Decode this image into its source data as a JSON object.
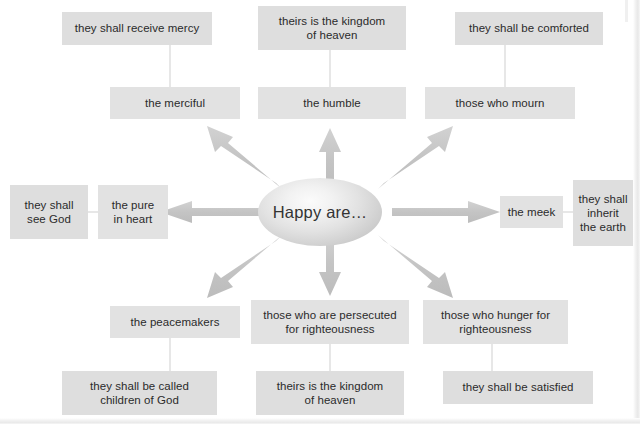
{
  "diagram": {
    "title": "Happy are…",
    "center": {
      "label": "Happy are…",
      "shape": "ellipse"
    },
    "colors": {
      "box_fill": "#e2e2e2",
      "promise_fill": "#dedede",
      "text": "#2b2b2b",
      "arrow": "#c6c6c6",
      "connector": "#cfcfcf",
      "background": "#ffffff"
    },
    "branches": [
      {
        "direction": "up-left",
        "trait": "the merciful",
        "promise_line1": "they shall receive mercy",
        "promise_line2": ""
      },
      {
        "direction": "up",
        "trait": "the humble",
        "promise_line1": "theirs is the kingdom",
        "promise_line2": "of heaven"
      },
      {
        "direction": "up-right",
        "trait": "those who mourn",
        "promise_line1": "they shall be comforted",
        "promise_line2": ""
      },
      {
        "direction": "left",
        "trait_line1": "the pure",
        "trait_line2": "in heart",
        "promise_line1": "they shall",
        "promise_line2": "see God"
      },
      {
        "direction": "right",
        "trait": "the meek",
        "promise_line1": "they shall",
        "promise_line2": "inherit",
        "promise_line3": "the earth"
      },
      {
        "direction": "down-left",
        "trait": "the peacemakers",
        "promise_line1": "they shall be called",
        "promise_line2": "children of God"
      },
      {
        "direction": "down",
        "trait_line1": "those who are persecuted",
        "trait_line2": "for righteousness",
        "promise_line1": "theirs is the kingdom",
        "promise_line2": "of heaven"
      },
      {
        "direction": "down-right",
        "trait_line1": "those who hunger for",
        "trait_line2": "righteousness",
        "promise_line1": "they shall be satisfied",
        "promise_line2": ""
      }
    ]
  }
}
